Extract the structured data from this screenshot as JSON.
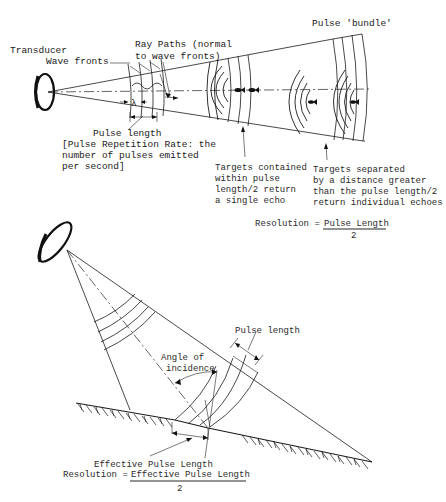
{
  "top_panel": {
    "labels": {
      "transducer": "Transducer",
      "wave_fronts": "Wave fronts",
      "ray_paths_line1": "Ray Paths (normal",
      "ray_paths_line2": "to wave fronts)",
      "pulse_bundle": "Pulse 'bundle'",
      "wavelength_symbol": "λ",
      "pulse_length": "Pulse length",
      "prr_line1": "[Pulse Repetition Rate: the",
      "prr_line2": "number of pulses emitted",
      "prr_line3": "per second]",
      "single_echo_line1": "Targets contained",
      "single_echo_line2": "within pulse",
      "single_echo_line3": "length/2 return",
      "single_echo_line4": "a single echo",
      "individual_echo_line1": "Targets separated",
      "individual_echo_line2": "by a distance greater",
      "individual_echo_line3": "than the pulse length/2",
      "individual_echo_line4": "return individual echoes"
    },
    "formula": {
      "lhs": "Resolution =",
      "numerator": "Pulse Length",
      "denominator": "2"
    }
  },
  "bottom_panel": {
    "labels": {
      "pulse_length": "Pulse length",
      "angle_line1": "Angle of",
      "angle_line2": "incidence",
      "effective_pulse_length": "Effective Pulse Length"
    },
    "formula": {
      "lhs": "Resolution =",
      "numerator": "Effective Pulse Length",
      "denominator": "2"
    }
  }
}
